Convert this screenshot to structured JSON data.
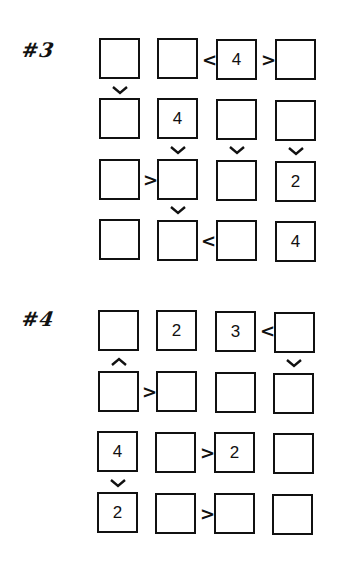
{
  "puzzles": [
    {
      "label": "#3",
      "givens": [
        [
          "",
          "",
          "4",
          ""
        ],
        [
          "",
          "4",
          "",
          ""
        ],
        [
          "",
          "",
          "",
          "2"
        ],
        [
          "",
          "",
          "",
          "4"
        ]
      ],
      "horizontal_constraints": [
        {
          "row": 1,
          "between_cols": [
            2,
            3
          ],
          "symbol": "<"
        },
        {
          "row": 1,
          "between_cols": [
            3,
            4
          ],
          "symbol": ">"
        },
        {
          "row": 3,
          "between_cols": [
            1,
            2
          ],
          "symbol": ">"
        },
        {
          "row": 4,
          "between_cols": [
            2,
            3
          ],
          "symbol": "<"
        }
      ],
      "vertical_constraints": [
        {
          "col": 1,
          "between_rows": [
            1,
            2
          ],
          "symbol": "v"
        },
        {
          "col": 2,
          "between_rows": [
            2,
            3
          ],
          "symbol": "v"
        },
        {
          "col": 3,
          "between_rows": [
            2,
            3
          ],
          "symbol": "v"
        },
        {
          "col": 4,
          "between_rows": [
            2,
            3
          ],
          "symbol": "v"
        },
        {
          "col": 2,
          "between_rows": [
            3,
            4
          ],
          "symbol": "v"
        }
      ]
    },
    {
      "label": "#4",
      "givens": [
        [
          "",
          "2",
          "3",
          ""
        ],
        [
          "",
          "",
          "",
          ""
        ],
        [
          "4",
          "",
          "2",
          ""
        ],
        [
          "2",
          "",
          "",
          ""
        ]
      ],
      "horizontal_constraints": [
        {
          "row": 1,
          "between_cols": [
            3,
            4
          ],
          "symbol": "<"
        },
        {
          "row": 2,
          "between_cols": [
            1,
            2
          ],
          "symbol": ">"
        },
        {
          "row": 3,
          "between_cols": [
            2,
            3
          ],
          "symbol": ">"
        },
        {
          "row": 4,
          "between_cols": [
            2,
            3
          ],
          "symbol": ">"
        }
      ],
      "vertical_constraints": [
        {
          "col": 1,
          "between_rows": [
            1,
            2
          ],
          "symbol": "^"
        },
        {
          "col": 4,
          "between_rows": [
            1,
            2
          ],
          "symbol": "v"
        },
        {
          "col": 1,
          "between_rows": [
            3,
            4
          ],
          "symbol": "v"
        }
      ]
    }
  ],
  "symbols": {
    "lt": "<",
    "gt": ">"
  }
}
